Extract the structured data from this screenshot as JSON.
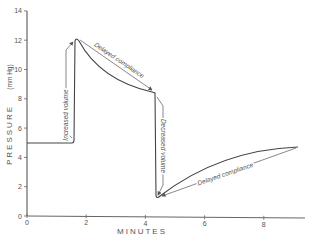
{
  "chart_data": {
    "type": "line",
    "title": "",
    "xlabel": "MINUTES",
    "ylabel": "PRESSURE (mm Hg)",
    "xlim": [
      0,
      9.3
    ],
    "ylim": [
      0,
      14
    ],
    "x_ticks": [
      "0",
      "2",
      "4",
      "6",
      "8"
    ],
    "y_ticks": [
      "0",
      "2",
      "4",
      "6",
      "8",
      "10",
      "12",
      "14"
    ],
    "grid": false,
    "series": [
      {
        "name": "pressure",
        "x": [
          0,
          1.75,
          1.8,
          4.3,
          4.4,
          9.1
        ],
        "y": [
          4.9,
          4.9,
          12.0,
          8.3,
          1.2,
          4.7
        ]
      }
    ],
    "annotations": [
      {
        "text": "Increased volume",
        "from": [
          1.75,
          4.9
        ],
        "to": [
          1.8,
          12.0
        ]
      },
      {
        "text": "Delayed compliance",
        "from": [
          1.8,
          12.0
        ],
        "to": [
          4.3,
          8.3
        ]
      },
      {
        "text": "Decreased volume",
        "from": [
          4.3,
          8.3
        ],
        "to": [
          4.4,
          1.2
        ]
      },
      {
        "text": "Delayed compliance",
        "from": [
          4.4,
          1.2
        ],
        "to": [
          9.1,
          4.7
        ]
      }
    ]
  },
  "labels": {
    "xlabel": "MINUTES",
    "ylabel_main": "PRESSURE",
    "ylabel_unit": "(mm Hg)",
    "ann_increased": "Increased volume",
    "ann_delayed1": "Delayed compliance",
    "ann_decreased": "Decreased volume",
    "ann_delayed2": "Delayed compliance"
  }
}
